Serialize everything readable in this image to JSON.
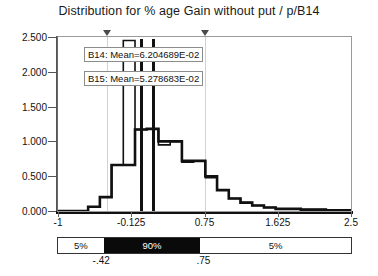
{
  "chart_data": {
    "type": "area",
    "title": "Distribution for % age Gain without put / p/B14",
    "xlabel": "",
    "ylabel": "",
    "xlim": [
      -1,
      2.5
    ],
    "ylim": [
      0,
      2.5
    ],
    "grid": true,
    "legend_position": "inline-callout",
    "xticks": [
      "-1",
      "-0.125",
      "0.75",
      "1.625",
      "2.5"
    ],
    "xtick_values": [
      -1,
      -0.125,
      0.75,
      1.625,
      2.5
    ],
    "yticks": [
      "0.000",
      "0.500",
      "1.000",
      "1.500",
      "2.000",
      "2.500"
    ],
    "ytick_values": [
      0,
      0.5,
      1.0,
      1.5,
      2.0,
      2.5
    ],
    "bin_edges": [
      -1.0,
      -0.78,
      -0.64,
      -0.5,
      -0.36,
      -0.22,
      -0.08,
      0.06,
      0.2,
      0.34,
      0.48,
      0.62,
      0.76,
      0.9,
      1.04,
      1.18,
      1.32,
      1.46,
      1.6,
      1.9,
      2.2,
      2.5
    ],
    "series": [
      {
        "name": "B14",
        "mean_label": "B14:  Mean=6.204689E-02",
        "mean": 0.06204689,
        "values": [
          0.0,
          0.0,
          0.06,
          0.2,
          0.66,
          0.66,
          1.17,
          1.18,
          1.0,
          1.0,
          0.72,
          0.72,
          0.5,
          0.3,
          0.18,
          0.12,
          0.08,
          0.05,
          0.03,
          0.02,
          0.01
        ]
      },
      {
        "name": "B15",
        "mean_label": "B15:  Mean=5.278683E-02",
        "mean": 0.05278683,
        "values": [
          0.0,
          0.0,
          0.06,
          0.2,
          0.66,
          2.45,
          1.17,
          1.18,
          0.95,
          1.0,
          0.7,
          0.72,
          0.48,
          0.3,
          0.18,
          0.12,
          0.08,
          0.05,
          0.03,
          0.02,
          0.01
        ]
      }
    ],
    "certainty_bar": {
      "segments": [
        {
          "label": "5%",
          "fill": "white"
        },
        {
          "label": "90%",
          "fill": "black"
        },
        {
          "label": "5%",
          "fill": "white"
        }
      ],
      "lower_bound_label": "-.42",
      "upper_bound_label": ".75",
      "lower_bound": -0.42,
      "upper_bound": 0.75
    },
    "markers": [
      {
        "name": "lower-percentile-marker",
        "value": -0.42
      },
      {
        "name": "upper-percentile-marker",
        "value": 0.75
      }
    ],
    "colors": {
      "series_line": "#111111",
      "axis": "#555555",
      "grid": "#d2d2d2",
      "bar_fill": "#0a0a0a",
      "background": "#ffffff"
    }
  }
}
